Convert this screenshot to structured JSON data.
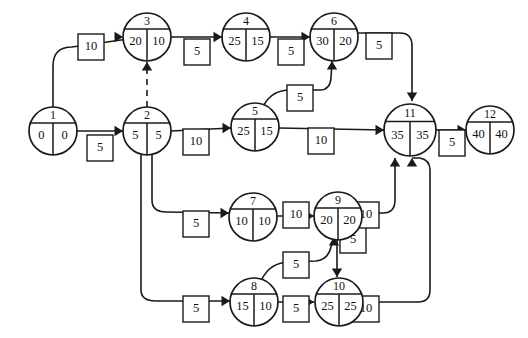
{
  "diagram": {
    "type": "activity-on-arrow-network",
    "width": 528,
    "height": 338,
    "background_color": "#ffffff",
    "line_color": "#1a1a1a"
  },
  "nodes": [
    {
      "id": "1",
      "left": "0",
      "right": "0",
      "cx": 53,
      "cy": 131,
      "r": 24
    },
    {
      "id": "2",
      "left": "5",
      "right": "5",
      "cx": 147,
      "cy": 131,
      "r": 24
    },
    {
      "id": "3",
      "left": "20",
      "right": "10",
      "cx": 147,
      "cy": 37,
      "r": 24
    },
    {
      "id": "4",
      "left": "25",
      "right": "15",
      "cx": 246,
      "cy": 37,
      "r": 24
    },
    {
      "id": "5",
      "left": "25",
      "right": "15",
      "cx": 255,
      "cy": 127,
      "r": 24
    },
    {
      "id": "6",
      "left": "30",
      "right": "20",
      "cx": 334,
      "cy": 37,
      "r": 24
    },
    {
      "id": "7",
      "left": "10",
      "right": "10",
      "cx": 253,
      "cy": 217,
      "r": 24
    },
    {
      "id": "8",
      "left": "15",
      "right": "10",
      "cx": 254,
      "cy": 302,
      "r": 24
    },
    {
      "id": "9",
      "left": "20",
      "right": "20",
      "cx": 338,
      "cy": 216,
      "r": 24
    },
    {
      "id": "10",
      "left": "25",
      "right": "25",
      "cx": 339,
      "cy": 302,
      "r": 24
    },
    {
      "id": "11",
      "left": "35",
      "right": "35",
      "cx": 410,
      "cy": 130,
      "r": 26
    },
    {
      "id": "12",
      "left": "40",
      "right": "40",
      "cx": 490,
      "cy": 130,
      "r": 24
    }
  ],
  "edges": [
    {
      "from": "1",
      "to": "3",
      "label": "10",
      "lx": 91,
      "ly": 47,
      "dashed": false,
      "path": "M 53 107 L 53 66 Q 53 47 72 47 L 142 37",
      "arrow": {
        "x": 123,
        "y": 37,
        "dir": "right"
      }
    },
    {
      "from": "1",
      "to": "2",
      "label": "5",
      "lx": 100,
      "ly": 148,
      "dashed": false,
      "path": "M 77 131 L 123 131",
      "arrow": {
        "x": 123,
        "y": 131,
        "dir": "right"
      }
    },
    {
      "from": "2",
      "to": "3",
      "label": "",
      "lx": 0,
      "ly": 0,
      "dashed": true,
      "path": "M 147 107 L 147 62",
      "arrow": {
        "x": 147,
        "y": 62,
        "dir": "up"
      }
    },
    {
      "from": "3",
      "to": "4",
      "label": "5",
      "lx": 197,
      "ly": 52,
      "dashed": false,
      "path": "M 171 37 L 222 37",
      "arrow": {
        "x": 222,
        "y": 37,
        "dir": "right"
      }
    },
    {
      "from": "4",
      "to": "6",
      "label": "5",
      "lx": 291,
      "ly": 52,
      "dashed": false,
      "path": "M 270 37 L 310 37",
      "arrow": {
        "x": 310,
        "y": 37,
        "dir": "right"
      }
    },
    {
      "from": "2",
      "to": "5",
      "label": "10",
      "lx": 196,
      "ly": 142,
      "dashed": false,
      "path": "M 171 131 L 231 128",
      "arrow": {
        "x": 231,
        "y": 128,
        "dir": "right"
      }
    },
    {
      "from": "5",
      "to": "6",
      "label": "5",
      "lx": 300,
      "ly": 98,
      "dashed": false,
      "path": "M 264 105 Q 272 90 290 90 L 320 90 Q 330 90 331 78 L 332 61",
      "arrow": {
        "x": 332,
        "y": 61,
        "dir": "up"
      }
    },
    {
      "from": "6",
      "to": "11",
      "label": "5",
      "lx": 379,
      "ly": 46,
      "dashed": false,
      "path": "M 358 33 L 400 33 Q 412 33 412 46 L 412 101",
      "arrow": {
        "x": 412,
        "y": 101,
        "dir": "down"
      }
    },
    {
      "from": "5",
      "to": "11",
      "label": "10",
      "lx": 321,
      "ly": 141,
      "dashed": false,
      "path": "M 279 128 L 384 130",
      "arrow": {
        "x": 384,
        "y": 130,
        "dir": "right"
      }
    },
    {
      "from": "11",
      "to": "12",
      "label": "5",
      "lx": 452,
      "ly": 143,
      "dashed": false,
      "path": "M 436 130 L 466 130",
      "arrow": {
        "x": 466,
        "y": 130,
        "dir": "right"
      }
    },
    {
      "from": "2",
      "to": "7",
      "label": "5",
      "lx": 196,
      "ly": 224,
      "dashed": false,
      "path": "M 152 155 L 152 200 Q 152 212 166 212 L 229 213",
      "arrow": {
        "x": 229,
        "y": 213,
        "dir": "right"
      }
    },
    {
      "from": "2",
      "to": "8",
      "label": "5",
      "lx": 196,
      "ly": 309,
      "dashed": false,
      "path": "M 141 155 L 141 290 Q 141 301 156 301 L 230 301",
      "arrow": {
        "x": 230,
        "y": 301,
        "dir": "right"
      }
    },
    {
      "from": "7",
      "to": "9",
      "label": "10",
      "lx": 296,
      "ly": 215,
      "dashed": false,
      "path": "M 277 216 L 314 216",
      "arrow": {
        "x": 314,
        "y": 216,
        "dir": "right"
      }
    },
    {
      "from": "8",
      "to": "9",
      "label": "5",
      "lx": 296,
      "ly": 265,
      "dashed": false,
      "path": "M 262 279 Q 270 263 288 262 L 316 261 Q 328 260 331 247 L 334 237",
      "arrow": {
        "x": 334,
        "y": 237,
        "dir": "up"
      }
    },
    {
      "from": "9",
      "to": "10",
      "label": "5",
      "lx": 353,
      "ly": 240,
      "dashed": false,
      "path": "M 337 240 L 337 277",
      "arrow": {
        "x": 337,
        "y": 277,
        "dir": "down"
      }
    },
    {
      "from": "8",
      "to": "10",
      "label": "5",
      "lx": 296,
      "ly": 309,
      "dashed": false,
      "path": "M 278 302 L 314 302",
      "arrow": {
        "x": 314,
        "y": 302,
        "dir": "right"
      }
    },
    {
      "from": "9",
      "to": "11",
      "label": "10",
      "lx": 366,
      "ly": 215,
      "dashed": false,
      "path": "M 362 213 L 383 213 Q 395 213 395 200 L 395 158",
      "arrow": {
        "x": 395,
        "y": 158,
        "dir": "up"
      }
    },
    {
      "from": "10",
      "to": "11",
      "label": "10",
      "lx": 366,
      "ly": 309,
      "dashed": false,
      "path": "M 363 302 L 418 302 Q 430 302 430 290 L 430 170 Q 430 160 420 158 L 412 158",
      "arrow": {
        "x": 412,
        "y": 158,
        "dir": "up"
      }
    }
  ]
}
